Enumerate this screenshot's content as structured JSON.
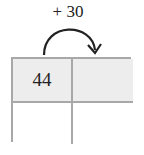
{
  "operation": {
    "label": "+ 30"
  },
  "grid": {
    "cells": [
      "44",
      "",
      "",
      ""
    ],
    "shaded_color": "#ededed",
    "border_color": "#a8a8a8"
  }
}
